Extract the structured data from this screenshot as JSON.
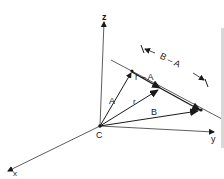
{
  "figure": {
    "colors": {
      "ink": "#1a1a1a",
      "background": "#ffffff",
      "edge": "#d8d8d8"
    },
    "origin_label": "C",
    "axes": {
      "z": {
        "label": "z"
      },
      "x": {
        "label": "x"
      },
      "y": {
        "label": "y"
      }
    },
    "vectors": {
      "A": {
        "label": "A"
      },
      "r": {
        "label": "r"
      },
      "B": {
        "label": "B"
      }
    },
    "line_label": "r – A",
    "span_label": "B – A"
  }
}
